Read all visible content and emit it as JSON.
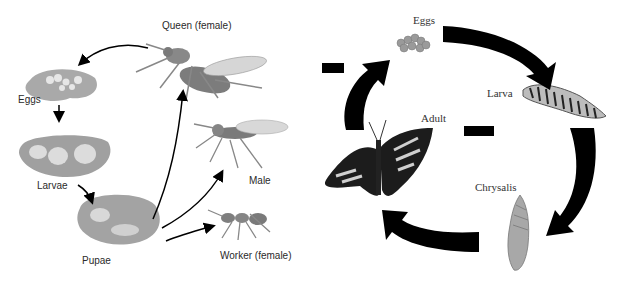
{
  "left_diagram": {
    "title": "Wasp/Ant life cycle",
    "stages": {
      "queen": "Queen (female)",
      "eggs": "Eggs",
      "larvae": "Larvae",
      "pupae": "Pupae",
      "male": "Male",
      "worker": "Worker (female)"
    }
  },
  "right_diagram": {
    "title": "Butterfly life cycle",
    "stages": {
      "eggs": "Eggs",
      "larva": "Larva",
      "chrysalis": "Chrysalis",
      "adult": "Adult"
    },
    "blank_boxes": 2
  },
  "colors": {
    "background": "#ffffff",
    "blob": "#a8a8a8",
    "insect": "#8a8a8a",
    "arrow": "#000000"
  }
}
